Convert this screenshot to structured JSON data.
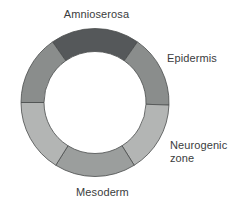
{
  "figure": {
    "type": "ring-diagram",
    "background_color": "#ffffff",
    "label_color": "#3a3c3d",
    "center": {
      "x": 95,
      "y": 102.5
    },
    "outer_radius": 74,
    "inner_radius": 51,
    "stroke_color": "#4a4c4d",
    "stroke_width": 0.8
  },
  "segments": [
    {
      "id": "amnioserosa",
      "name": "Amnioserosa",
      "color": "#55585a",
      "start_angle": -125,
      "end_angle": -55
    },
    {
      "id": "epidermis",
      "name": "Epidermis",
      "color": "#8a8d8c",
      "start_angle": -55,
      "end_angle": 2
    },
    {
      "id": "neurogenic-zone",
      "name": "Neurogenic zone",
      "color": "#b3b5b4",
      "start_angle": 2,
      "end_angle": 58
    },
    {
      "id": "mesoderm",
      "name": "Mesoderm",
      "color": "#9b9e9d",
      "start_angle": 58,
      "end_angle": 122
    },
    {
      "id": "segment-lower-left",
      "name": "",
      "color": "#b3b5b4",
      "start_angle": 122,
      "end_angle": 180
    },
    {
      "id": "segment-upper-left",
      "name": "",
      "color": "#8a8d8c",
      "start_angle": 180,
      "end_angle": 235
    }
  ],
  "labels": {
    "amnioserosa": "Amnioserosa",
    "epidermis": "Epidermis",
    "neurogenic_zone": "Neurogenic\nzone",
    "mesoderm": "Mesoderm"
  }
}
